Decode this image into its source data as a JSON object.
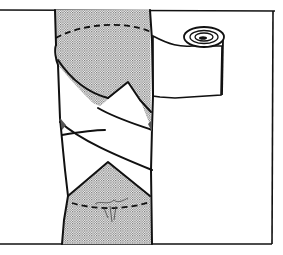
{
  "figure": {
    "colors": {
      "ink": "#111111",
      "paper": "#ffffff",
      "stipple": "#9a9a9a"
    },
    "parts": [
      "limb-skin-stippled",
      "bandage-turns",
      "bandage-roll",
      "dashed-wound-outline-top",
      "dashed-wound-outline-bottom",
      "wound-mark",
      "frame"
    ]
  }
}
